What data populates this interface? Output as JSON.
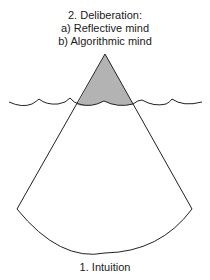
{
  "diagram": {
    "type": "iceberg-metaphor",
    "top_label": {
      "title": "2. Deliberation:",
      "line_a": "a) Reflective mind",
      "line_b": "b) Algorithmic mind"
    },
    "bottom_label": "1. Intuition",
    "colors": {
      "stroke": "#222222",
      "tip_fill": "#b3b3b3",
      "background": "#ffffff"
    }
  }
}
